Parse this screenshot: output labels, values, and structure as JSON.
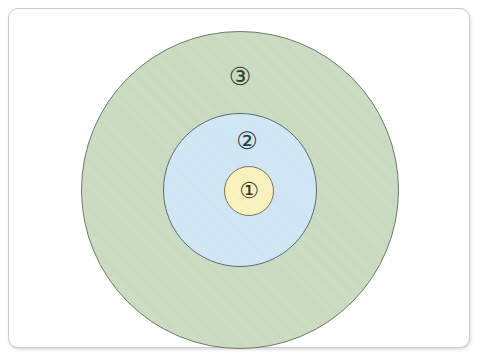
{
  "figure": {
    "type": "concentric-circles-diagram",
    "background_color": "#ffffff",
    "frame": {
      "border_color": "#c9c9c9",
      "corner_radius_px": 10
    },
    "labels": {
      "outer": "③",
      "middle": "②",
      "inner": "①"
    },
    "regions": [
      {
        "id": "inner",
        "label": "①",
        "fill_color": "#faf2bc",
        "stroke_color": "#7a7558",
        "center_x": 240,
        "center_y": 182,
        "radius": 25
      },
      {
        "id": "middle",
        "label": "②",
        "fill_color": "#cfe6f5",
        "stroke_color": "#5c6b74",
        "center_x": 231,
        "center_y": 181,
        "radius": 77
      },
      {
        "id": "outer",
        "label": "③",
        "fill_color": "#c9dabf",
        "stroke_color": "#6c7a68",
        "center_x": 231,
        "center_y": 181,
        "radius": 159
      }
    ]
  },
  "chart_data": {
    "type": "pie",
    "title": "",
    "xlabel": "",
    "ylabel": "",
    "legend": [],
    "categories": [
      "①",
      "②",
      "③"
    ],
    "values": [
      25,
      77,
      159
    ],
    "value_meaning": "circle radius in pixels (nested concentric zones)",
    "colors": [
      "#faf2bc",
      "#cfe6f5",
      "#c9dabf"
    ],
    "grid": false
  }
}
